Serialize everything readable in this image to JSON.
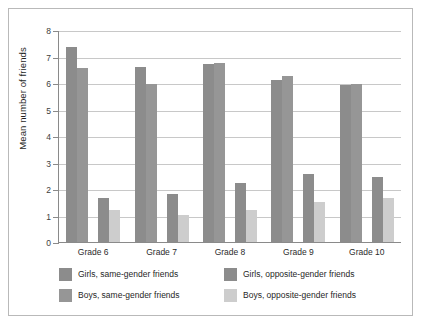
{
  "chart_data": {
    "type": "bar",
    "title": "",
    "xlabel": "",
    "ylabel": "Mean number of friends",
    "ylim": [
      0,
      8
    ],
    "yticks": [
      "0",
      "1",
      "2",
      "3",
      "4",
      "5",
      "6",
      "7",
      "8"
    ],
    "grid": true,
    "legend_position": "bottom",
    "categories": [
      "Grade 6",
      "Grade 7",
      "Grade 8",
      "Grade 9",
      "Grade 10"
    ],
    "series": [
      {
        "name": "Girls, same-gender friends",
        "color": "#8c8c8c",
        "values": [
          7.4,
          6.65,
          6.75,
          6.15,
          5.95
        ]
      },
      {
        "name": "Boys, same-gender friends",
        "color": "#969696",
        "values": [
          6.6,
          6.0,
          6.8,
          6.3,
          6.0
        ]
      },
      {
        "name": "Girls, opposite-gender friends",
        "color": "#8c8c8c",
        "values": [
          1.7,
          1.85,
          2.25,
          2.6,
          2.5
        ]
      },
      {
        "name": "Boys, opposite-gender friends",
        "color": "#cdcdcd",
        "values": [
          1.25,
          1.05,
          1.25,
          1.55,
          1.7
        ]
      }
    ]
  },
  "figure": {
    "border_color": "#b9b9b9",
    "background": "#ffffff",
    "gridline_color": "#c8c8c8",
    "axis_color": "#8a8a8a"
  }
}
